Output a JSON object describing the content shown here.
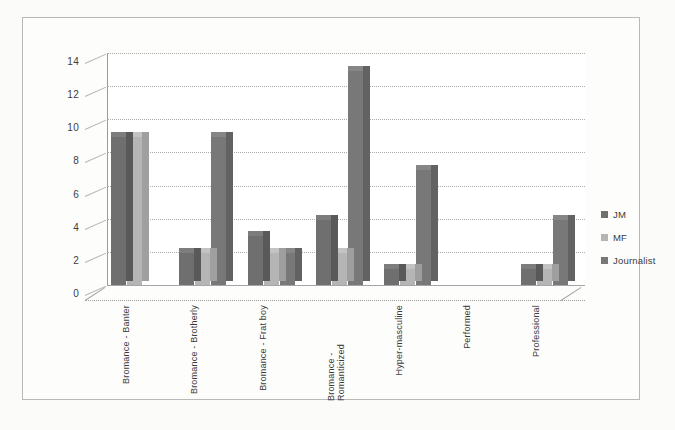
{
  "chart_data": {
    "type": "bar",
    "title": "",
    "subtitle": "",
    "xlabel": "",
    "ylabel": "",
    "ylim": [
      0,
      14
    ],
    "ytick_step": 2,
    "yticks": [
      14,
      12,
      10,
      8,
      6,
      4,
      2,
      0
    ],
    "grid": true,
    "legend_position": "right",
    "style": "3d-clustered-column",
    "categories": [
      "Bromance - Banter",
      "Bromance - Brotherly",
      "Bromance - Frat boy",
      "Bromance - Romanticized",
      "Hyper-masculine",
      "Performed",
      "Professional"
    ],
    "series": [
      {
        "name": "JM",
        "color": "#6f6f6f",
        "values": [
          9,
          2,
          3,
          4,
          1,
          0,
          1
        ]
      },
      {
        "name": "MF",
        "color": "#b5b5b5",
        "values": [
          9,
          2,
          2,
          2,
          1,
          0,
          1
        ]
      },
      {
        "name": "Journalist",
        "color": "#787878",
        "values": [
          0,
          9,
          2,
          13,
          7,
          0,
          4
        ]
      }
    ]
  },
  "legend": {
    "items": [
      {
        "label": "JM"
      },
      {
        "label": "MF"
      },
      {
        "label": "Journalist"
      }
    ]
  },
  "colors": {
    "series_jm": "#6f6f6f",
    "series_mf": "#b5b5b5",
    "series_journalist": "#787878",
    "gridline": "#aaaaa8",
    "axis": "#9a9a98",
    "text": "#3a3a3a",
    "background": "#fdfdfc",
    "frame": "#b9b9b7"
  }
}
